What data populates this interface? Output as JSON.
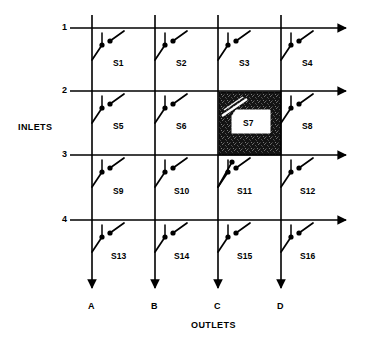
{
  "diagram": {
    "type": "crossbar-switch-matrix",
    "title_inlets": "INLETS",
    "title_outlets": "OUTLETS",
    "colors": {
      "line": "#000000",
      "background": "#ffffff",
      "highlight_fill": "#1a1a1a",
      "highlight_label_fill": "#ffffff"
    },
    "rows": [
      {
        "id": "row-1",
        "label": "1",
        "y": 28
      },
      {
        "id": "row-2",
        "label": "2",
        "y": 91
      },
      {
        "id": "row-3",
        "label": "3",
        "y": 155
      },
      {
        "id": "row-4",
        "label": "4",
        "y": 220
      }
    ],
    "columns": [
      {
        "id": "col-a",
        "label": "A",
        "x": 92
      },
      {
        "id": "col-b",
        "label": "B",
        "x": 155
      },
      {
        "id": "col-c",
        "label": "C",
        "x": 218
      },
      {
        "id": "col-d",
        "label": "D",
        "x": 281
      }
    ],
    "switches": [
      {
        "id": "S1",
        "label": "S1",
        "row": 1,
        "col": "A",
        "label_x": 113,
        "label_y": 59,
        "highlighted": false
      },
      {
        "id": "S2",
        "label": "S2",
        "row": 1,
        "col": "B",
        "label_x": 176,
        "label_y": 59,
        "highlighted": false
      },
      {
        "id": "S3",
        "label": "S3",
        "row": 1,
        "col": "C",
        "label_x": 239,
        "label_y": 59,
        "highlighted": false
      },
      {
        "id": "S4",
        "label": "S4",
        "row": 1,
        "col": "D",
        "label_x": 302,
        "label_y": 59,
        "highlighted": false
      },
      {
        "id": "S5",
        "label": "S5",
        "row": 2,
        "col": "A",
        "label_x": 113,
        "label_y": 122,
        "highlighted": false
      },
      {
        "id": "S6",
        "label": "S6",
        "row": 2,
        "col": "B",
        "label_x": 176,
        "label_y": 122,
        "highlighted": false
      },
      {
        "id": "S7",
        "label": "S7",
        "row": 2,
        "col": "C",
        "label_x": 243,
        "label_y": 122,
        "highlighted": true
      },
      {
        "id": "S8",
        "label": "S8",
        "row": 2,
        "col": "D",
        "label_x": 302,
        "label_y": 122,
        "highlighted": false
      },
      {
        "id": "S9",
        "label": "S9",
        "row": 3,
        "col": "A",
        "label_x": 113,
        "label_y": 187,
        "highlighted": false
      },
      {
        "id": "S10",
        "label": "S10",
        "row": 3,
        "col": "B",
        "label_x": 174,
        "label_y": 187,
        "highlighted": false
      },
      {
        "id": "S11",
        "label": "S11",
        "row": 3,
        "col": "C",
        "label_x": 237,
        "label_y": 187,
        "highlighted": false
      },
      {
        "id": "S12",
        "label": "S12",
        "row": 3,
        "col": "D",
        "label_x": 300,
        "label_y": 187,
        "highlighted": false
      },
      {
        "id": "S13",
        "label": "S13",
        "row": 4,
        "col": "A",
        "label_x": 111,
        "label_y": 252,
        "highlighted": false
      },
      {
        "id": "S14",
        "label": "S14",
        "row": 4,
        "col": "B",
        "label_x": 174,
        "label_y": 252,
        "highlighted": false
      },
      {
        "id": "S15",
        "label": "S15",
        "row": 4,
        "col": "C",
        "label_x": 237,
        "label_y": 252,
        "highlighted": false
      },
      {
        "id": "S16",
        "label": "S16",
        "row": 4,
        "col": "D",
        "label_x": 300,
        "label_y": 252,
        "highlighted": false
      }
    ],
    "row_label_positions": [
      {
        "x": 62,
        "y": 23
      },
      {
        "x": 62,
        "y": 86
      },
      {
        "x": 62,
        "y": 150
      },
      {
        "x": 62,
        "y": 215
      }
    ],
    "col_label_positions": [
      {
        "x": 88,
        "y": 302
      },
      {
        "x": 151,
        "y": 302
      },
      {
        "x": 214,
        "y": 302
      },
      {
        "x": 277,
        "y": 302
      }
    ],
    "inlets_label_position": {
      "x": 18,
      "y": 123
    },
    "outlets_label_position": {
      "x": 191,
      "y": 321
    },
    "highlight_cell": {
      "x": 219,
      "y": 92,
      "width": 62,
      "height": 63,
      "label_box": {
        "x": 232,
        "y": 112,
        "width": 38,
        "height": 21
      }
    }
  }
}
